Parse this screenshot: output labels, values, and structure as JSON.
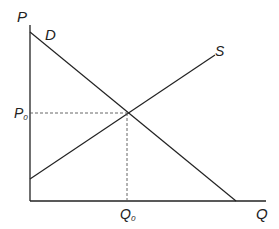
{
  "diagram": {
    "axes": {
      "y_label": "P",
      "x_label": "Q"
    },
    "curves": [
      {
        "name": "demand",
        "label": "D"
      },
      {
        "name": "supply",
        "label": "S"
      }
    ],
    "equilibrium": {
      "price_label": "P",
      "price_sub": "0",
      "quantity_label": "Q",
      "quantity_sub": "0"
    },
    "colors": {
      "line": "#222222",
      "dashed": "#555555"
    }
  }
}
